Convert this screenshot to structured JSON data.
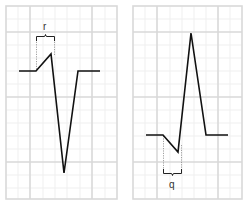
{
  "panels": [
    {
      "id": "left",
      "wave_label": "r",
      "label_position": "above",
      "description": "Small upward r wave followed by deep downward deflection (rS complex)"
    },
    {
      "id": "right",
      "wave_label": "q",
      "label_position": "below",
      "description": "Small downward q wave followed by tall upward R wave (qR complex)"
    }
  ],
  "colors": {
    "grid_major": "#d9d9d9",
    "grid_minor": "#efefef",
    "trace": "#111111",
    "bracket": "#222222",
    "dotted": "#888888"
  }
}
